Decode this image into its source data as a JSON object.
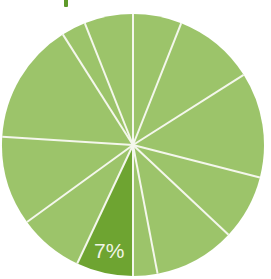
{
  "chart_data": {
    "type": "pie",
    "title": "",
    "start_angle_deg": 0,
    "direction": "clockwise",
    "center": [
      133,
      145
    ],
    "radius": 131,
    "separator_color": "#f4f7ec",
    "separator_width": 2,
    "slices": [
      {
        "value": 6,
        "color": "#9cc46a",
        "label": ""
      },
      {
        "value": 10,
        "color": "#9cc46a",
        "label": ""
      },
      {
        "value": 13,
        "color": "#9cc46a",
        "label": ""
      },
      {
        "value": 8,
        "color": "#9cc46a",
        "label": ""
      },
      {
        "value": 10,
        "color": "#9cc46a",
        "label": ""
      },
      {
        "value": 3,
        "color": "#9cc46a",
        "label": ""
      },
      {
        "value": 7,
        "color": "#6ea431",
        "label": "7%",
        "highlighted": true
      },
      {
        "value": 8,
        "color": "#9cc46a",
        "label": ""
      },
      {
        "value": 11,
        "color": "#9cc46a",
        "label": ""
      },
      {
        "value": 15,
        "color": "#9cc46a",
        "label": ""
      },
      {
        "value": 3,
        "color": "#9cc46a",
        "label": ""
      },
      {
        "value": 6,
        "color": "#9cc46a",
        "label": ""
      }
    ],
    "values": [
      6,
      10,
      13,
      8,
      10,
      3,
      7,
      8,
      11,
      15,
      3,
      6
    ],
    "visible_labels": [
      "7%"
    ],
    "legend": null
  },
  "highlight_label": "7%",
  "colors": {
    "base_slice": "#9cc46a",
    "highlight_slice": "#6ea431",
    "title_fragment": "#5e9a2a",
    "label_text": "#f1f5e6"
  }
}
